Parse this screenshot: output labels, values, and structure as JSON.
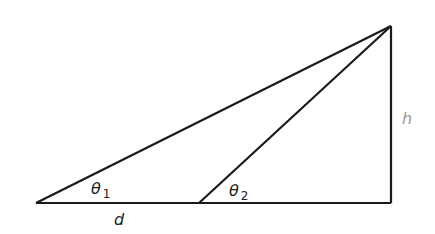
{
  "diagram": {
    "title": "",
    "colors": {
      "line": "#1a1a1a",
      "label": "#222222",
      "h_label": "#9a9a9a",
      "background": "#ffffff"
    },
    "points": {
      "left_vertex": [
        36,
        203
      ],
      "mid_vertex": [
        199,
        203
      ],
      "right_base": [
        391,
        203
      ],
      "apex": [
        391,
        26
      ]
    },
    "labels": {
      "theta1": {
        "symbol": "θ",
        "subscript": "1"
      },
      "theta2": {
        "symbol": "θ",
        "subscript": "2"
      },
      "d": "d",
      "h": "h"
    }
  }
}
